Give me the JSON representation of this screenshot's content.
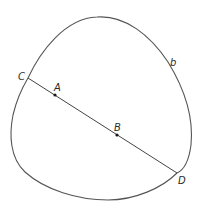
{
  "diagram": {
    "curve": {
      "label": "b",
      "stroke": "#555555"
    },
    "chord": {
      "from": "C",
      "to": "D",
      "stroke": "#444444"
    },
    "points": [
      {
        "id": "C",
        "label": "C",
        "on": "curve"
      },
      {
        "id": "A",
        "label": "A",
        "on": "chord",
        "marked": true
      },
      {
        "id": "B",
        "label": "B",
        "on": "chord",
        "marked": true
      },
      {
        "id": "D",
        "label": "D",
        "on": "curve"
      }
    ],
    "labels": {
      "curve": "b",
      "C": "C",
      "A": "A",
      "B": "B",
      "D": "D"
    }
  }
}
